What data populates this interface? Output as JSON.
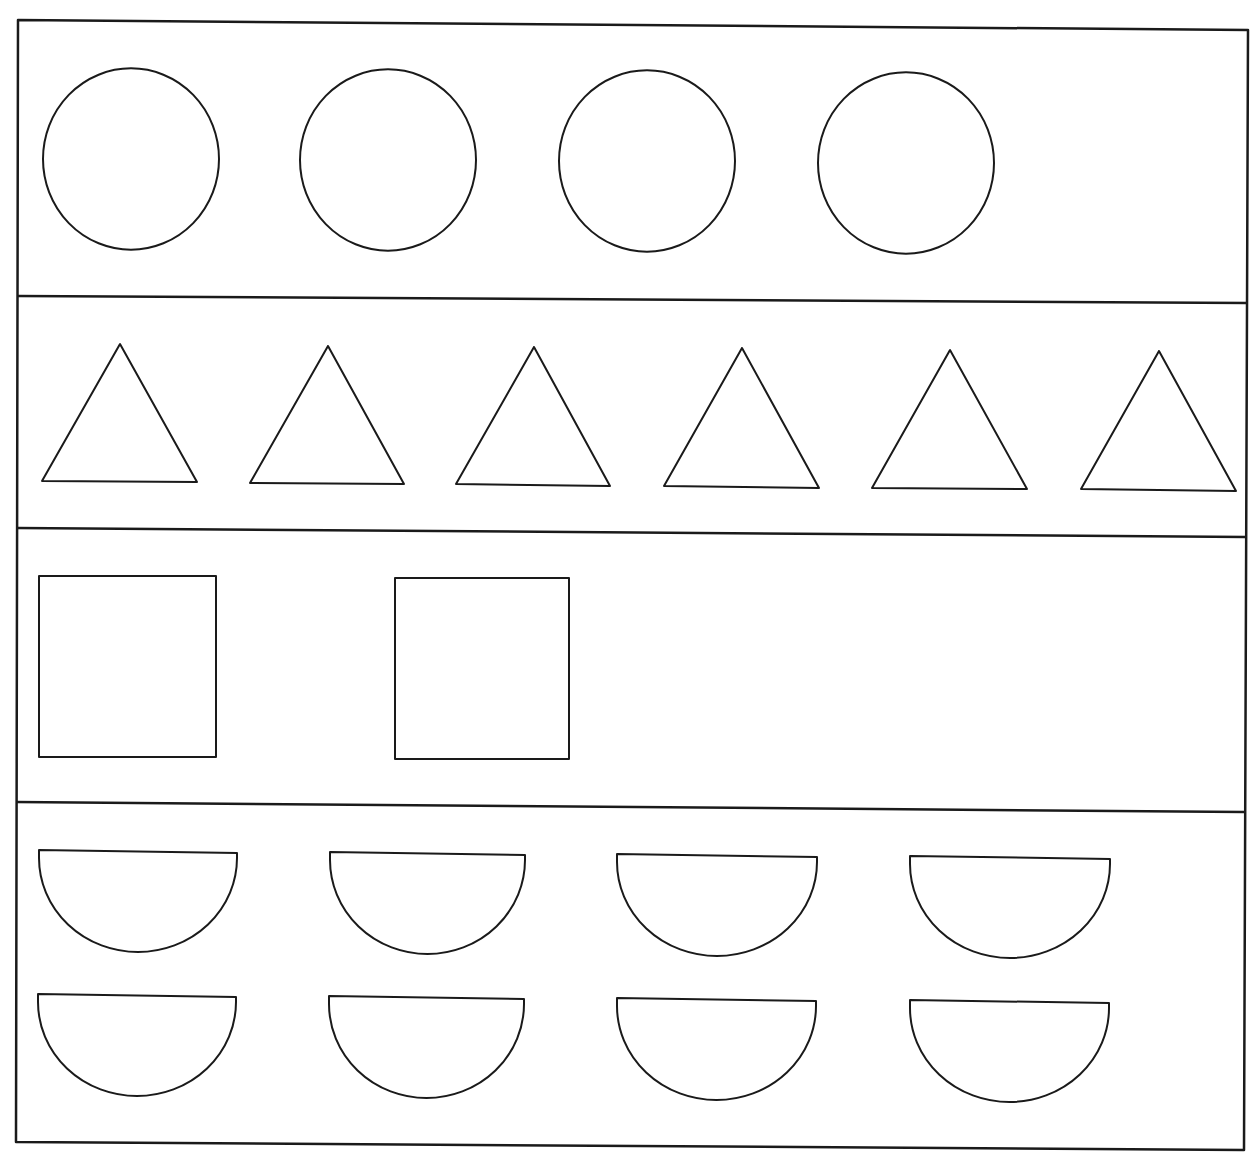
{
  "worksheet": {
    "background": "#ffffff",
    "stroke_color": "#1a1a1a",
    "frame": {
      "x1": 18,
      "y1": 20,
      "x2": 1248,
      "y2": 1150
    },
    "dividers": [
      {
        "x1": 18,
        "y1": 296,
        "x2": 1248,
        "y2": 303
      },
      {
        "x1": 17,
        "y1": 528,
        "x2": 1246,
        "y2": 537
      },
      {
        "x1": 16,
        "y1": 802,
        "x2": 1244,
        "y2": 812
      }
    ],
    "rows": [
      {
        "name": "circles-row",
        "shape": "circle",
        "count": 4,
        "items": [
          {
            "cx": 131,
            "cy": 159,
            "r": 88
          },
          {
            "cx": 388,
            "cy": 160,
            "r": 88
          },
          {
            "cx": 647,
            "cy": 161,
            "r": 88
          },
          {
            "cx": 906,
            "cy": 163,
            "r": 88
          }
        ]
      },
      {
        "name": "triangles-row",
        "shape": "triangle",
        "count": 6,
        "items": [
          {
            "points": "120,344 42,481 197,482"
          },
          {
            "points": "328,346 250,483 404,484"
          },
          {
            "points": "534,347 456,484 610,486"
          },
          {
            "points": "742,348 664,486 819,488"
          },
          {
            "points": "950,350 872,488 1027,489"
          },
          {
            "points": "1159,351 1081,489 1236,491"
          }
        ]
      },
      {
        "name": "squares-row",
        "shape": "rectangle",
        "count": 2,
        "items": [
          {
            "x": 39,
            "y": 576,
            "w": 177,
            "h": 181
          },
          {
            "x": 395,
            "y": 578,
            "w": 174,
            "h": 181
          }
        ]
      },
      {
        "name": "semicircles-row",
        "shape": "semicircle",
        "count": 8,
        "items": [
          {
            "x1": 39,
            "x2": 237,
            "y": 850,
            "depth": 102
          },
          {
            "x1": 330,
            "x2": 525,
            "y": 852,
            "depth": 102
          },
          {
            "x1": 617,
            "x2": 817,
            "y": 854,
            "depth": 102
          },
          {
            "x1": 910,
            "x2": 1110,
            "y": 856,
            "depth": 102
          },
          {
            "x1": 38,
            "x2": 236,
            "y": 994,
            "depth": 102
          },
          {
            "x1": 329,
            "x2": 524,
            "y": 996,
            "depth": 102
          },
          {
            "x1": 617,
            "x2": 816,
            "y": 998,
            "depth": 102
          },
          {
            "x1": 910,
            "x2": 1109,
            "y": 1000,
            "depth": 102
          }
        ]
      }
    ]
  }
}
